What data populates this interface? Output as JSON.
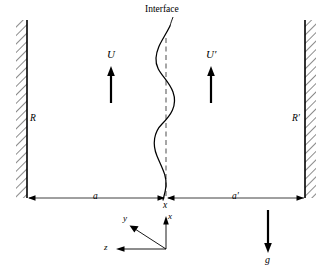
{
  "figure": {
    "title_label": "Interface",
    "background_color": "#ffffff",
    "stroke_color": "#000000",
    "width": 328,
    "height": 274
  },
  "walls": {
    "left": {
      "label": "R",
      "x": 27,
      "top": 20,
      "bottom": 198,
      "hatch_side": "left"
    },
    "right": {
      "label": "R′",
      "x": 305,
      "top": 20,
      "bottom": 198,
      "hatch_side": "right"
    }
  },
  "velocity_arrows": [
    {
      "label": "U",
      "name": "velocity-arrow-left",
      "x": 111,
      "tip_y": 67,
      "tail_y": 103,
      "direction": "up"
    },
    {
      "label": "U′",
      "name": "velocity-arrow-right",
      "x": 211,
      "tip_y": 67,
      "tail_y": 103,
      "direction": "up"
    }
  ],
  "gravity_arrow": {
    "label": "g",
    "x": 268,
    "tail_y": 210,
    "tip_y": 252,
    "direction": "down"
  },
  "interface": {
    "label": "Interface",
    "centerline_x": 166,
    "top_y": 26,
    "bottom_y": 200,
    "dashed_top_y": 38,
    "dashed_bottom_y": 196,
    "amplitude": 12,
    "wave_description": "sinusoidal perturbed interface about vertical centerline"
  },
  "dimension_line": {
    "y": 198,
    "left_x": 27,
    "right_x": 305,
    "center_x": 166,
    "left_label": "a",
    "right_label": "a′",
    "center_label": "x"
  },
  "coordinate_axes": {
    "origin_x": 166,
    "origin_y": 249,
    "axes": [
      {
        "label": "x",
        "name": "axis-x",
        "dx": 0,
        "dy": -32
      },
      {
        "label": "y",
        "name": "axis-y",
        "dx": -38,
        "dy": -25
      },
      {
        "label": "z",
        "name": "axis-z",
        "dx": -55,
        "dy": 0
      }
    ]
  }
}
